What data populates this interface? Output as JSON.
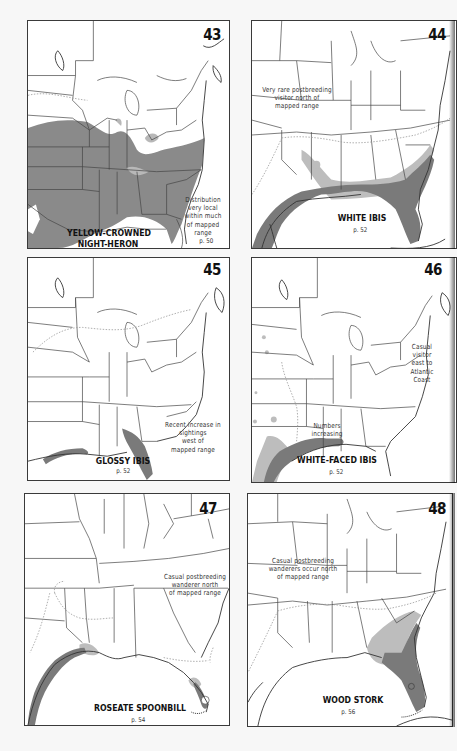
{
  "page": {
    "background": "#f7f7f7",
    "range_color_dark": "#7a7a7a",
    "range_color_light": "#b8b8b8",
    "border_color": "#3a3a3a"
  },
  "maps": [
    {
      "number": "43",
      "species_line1": "YELLOW-CROWNED",
      "species_line2": "NIGHT-HERON",
      "page_ref": "p. 50",
      "note": "Distribution\nvery local\nwithin much\nof mapped\nrange"
    },
    {
      "number": "44",
      "species_line1": "WHITE IBIS",
      "species_line2": "",
      "page_ref": "p. 52",
      "note": "Very rare postbreeding\nvisitor north of\nmapped range"
    },
    {
      "number": "45",
      "species_line1": "GLOSSY IBIS",
      "species_line2": "",
      "page_ref": "p. 52",
      "note": "Recent increase in\nsightings\nwest of\nmapped range"
    },
    {
      "number": "46",
      "species_line1": "WHITE-FACED IBIS",
      "species_line2": "",
      "page_ref": "p. 52",
      "note": "Casual\nvisitor\neast to\nAtlantic\nCoast",
      "note2": "Numbers\nincreasing"
    },
    {
      "number": "47",
      "species_line1": "ROSEATE SPOONBILL",
      "species_line2": "",
      "page_ref": "p. 54",
      "note": "Casual postbreeding\nwanderer north\nof mapped range"
    },
    {
      "number": "48",
      "species_line1": "WOOD STORK",
      "species_line2": "",
      "page_ref": "p. 56",
      "note": "Casual postbreeding\nwanderers occur north\nof mapped range"
    }
  ]
}
